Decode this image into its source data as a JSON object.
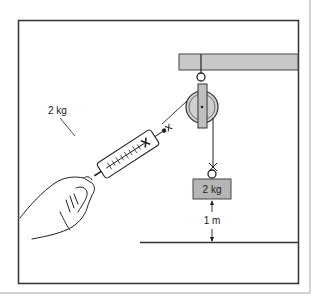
{
  "diagram": {
    "labels": {
      "scale_reading": "2 kg",
      "mass_label": "2 kg",
      "height_label": "1 m"
    },
    "colors": {
      "frame": "#333333",
      "beam_fill": "#c8c8c8",
      "pulley_fill": "#cfcfcf",
      "weight_fill": "#b5b5b5",
      "line": "#222222",
      "page_border": "#c4c4c4"
    }
  }
}
